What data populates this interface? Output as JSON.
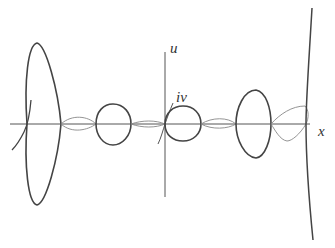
{
  "figure": {
    "axes": {
      "x_label": "x",
      "u_label": "u"
    },
    "annotations": {
      "iv_label": "iv"
    },
    "colors": {
      "axis": "#555555",
      "thick_curve": "#444444",
      "thin_curve": "#888888",
      "background": "#ffffff"
    }
  }
}
